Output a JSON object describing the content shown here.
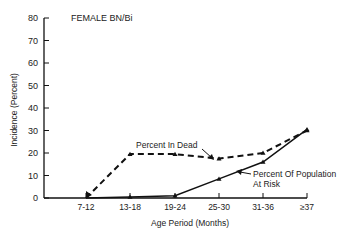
{
  "chart_data": {
    "type": "line",
    "title": "FEMALE BN/Bi",
    "xlabel": "Age Period (Months)",
    "ylabel": "Incidence (Percent)",
    "categories": [
      "7-12",
      "13-18",
      "19-24",
      "25-30",
      "31-36",
      "≥37"
    ],
    "ylim": [
      0,
      80
    ],
    "yticks": [
      0,
      10,
      20,
      30,
      40,
      50,
      60,
      70,
      80
    ],
    "grid": false,
    "series": [
      {
        "name": "Percent In Dead",
        "style": "dashed",
        "values": [
          0,
          19.5,
          19.5,
          17.5,
          20,
          30
        ]
      },
      {
        "name": "Percent Of Population At Risk",
        "style": "solid",
        "values": [
          0,
          0.5,
          1,
          8.5,
          16,
          30.5
        ]
      }
    ],
    "annotations": [
      {
        "text": "Percent In Dead",
        "points_to": "Percent In Dead"
      },
      {
        "text_line1": "Percent Of Population",
        "text_line2": "At Risk",
        "points_to": "Percent Of Population At Risk"
      }
    ]
  }
}
